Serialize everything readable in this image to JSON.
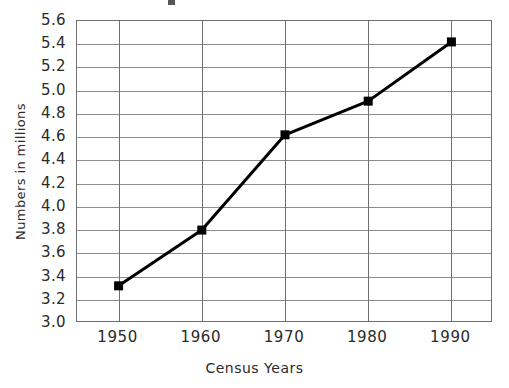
{
  "figure": {
    "background_color": "#ffffff",
    "frame_color": "#6e6e6e",
    "grid_color": "#8d8d8d",
    "series_color": "#000000",
    "title_fragment_name": "cropped-title-fragment"
  },
  "chart_data": {
    "type": "line",
    "title": "",
    "xlabel": "Census Years",
    "ylabel": "Numbers in millions",
    "categories": [
      "1950",
      "1960",
      "1970",
      "1980",
      "1990"
    ],
    "x": [
      1950,
      1960,
      1970,
      1980,
      1990
    ],
    "values": [
      3.32,
      3.8,
      4.62,
      4.91,
      5.42
    ],
    "series": [
      {
        "name": "Population",
        "values": [
          3.32,
          3.8,
          4.62,
          4.91,
          5.42
        ]
      }
    ],
    "ylim": [
      3.0,
      5.6
    ],
    "ytick_step": 0.2,
    "ytick_labels": [
      "5.6",
      "5.4",
      "5.2",
      "5.0",
      "4.8",
      "4.6",
      "4.4",
      "4.2",
      "4.0",
      "3.8",
      "3.6",
      "3.4",
      "3.2",
      "3.0"
    ],
    "ytick_values": [
      5.6,
      5.4,
      5.2,
      5.0,
      4.8,
      4.6,
      4.4,
      4.2,
      4.0,
      3.8,
      3.6,
      3.4,
      3.2,
      3.0
    ],
    "xtick_labels": [
      "1950",
      "1960",
      "1970",
      "1980",
      "1990"
    ],
    "grid": "horizontal-and-vertical",
    "legend": "none",
    "marker": "filled-square",
    "line_width": 3
  }
}
